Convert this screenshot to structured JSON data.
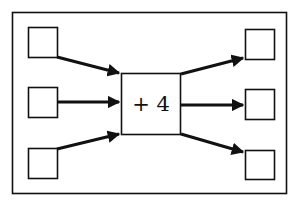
{
  "diagram": {
    "type": "function-machine",
    "operation": {
      "label": "+ 4"
    },
    "inputs": [
      {
        "value": ""
      },
      {
        "value": ""
      },
      {
        "value": ""
      }
    ],
    "outputs": [
      {
        "value": ""
      },
      {
        "value": ""
      },
      {
        "value": ""
      }
    ],
    "colors": {
      "stroke": "#111111",
      "background": "#ffffff"
    }
  }
}
